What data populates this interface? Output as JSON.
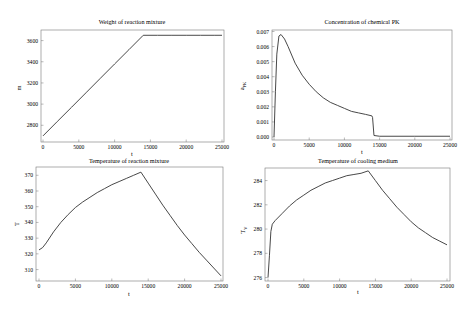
{
  "chart_data": [
    {
      "type": "line",
      "title": "Weight of reaction mixture",
      "xlabel": "t",
      "ylabel": "m",
      "xlim": [
        0,
        25000
      ],
      "ylim": [
        2680,
        3700
      ],
      "xticks": [
        0,
        5000,
        10000,
        15000,
        20000,
        25000
      ],
      "xtick_labels": [
        "0",
        "5000",
        "10000",
        "15000",
        "20000",
        "25000"
      ],
      "yticks": [
        2800,
        3000,
        3200,
        3400,
        3600
      ],
      "ytick_labels": [
        "2800",
        "3000",
        "3200",
        "3400",
        "3600"
      ],
      "grid": false,
      "series": [
        {
          "name": "m",
          "x": [
            0,
            2000,
            4000,
            6000,
            8000,
            10000,
            12000,
            14000,
            16000,
            18000,
            20000,
            22000,
            24000,
            25000
          ],
          "y": [
            2700,
            2836,
            2971,
            3107,
            3243,
            3379,
            3514,
            3650,
            3650,
            3650,
            3650,
            3650,
            3650,
            3650
          ]
        }
      ]
    },
    {
      "type": "line",
      "title": "Concentration of chemical PK",
      "xlabel": "t",
      "ylabel": "aPK",
      "xlim": [
        0,
        25000
      ],
      "ylim": [
        -0.0001,
        0.007
      ],
      "xticks": [
        0,
        5000,
        10000,
        15000,
        20000,
        25000
      ],
      "xtick_labels": [
        "0",
        "5000",
        "10000",
        "15000",
        "20000",
        "25000"
      ],
      "yticks": [
        0.0,
        0.001,
        0.002,
        0.003,
        0.004,
        0.005,
        0.006,
        0.007
      ],
      "ytick_labels": [
        "0.000",
        "0.001",
        "0.002",
        "0.003",
        "0.004",
        "0.005",
        "0.006",
        "0.007"
      ],
      "grid": false,
      "series": [
        {
          "name": "aPK",
          "x": [
            0,
            200,
            400,
            700,
            1000,
            1500,
            2000,
            3000,
            4000,
            5000,
            6000,
            7000,
            8000,
            9000,
            10000,
            11000,
            12000,
            13000,
            13900,
            14000,
            14200,
            15000,
            20000,
            25000
          ],
          "y": [
            0.0,
            0.003,
            0.0055,
            0.0067,
            0.0068,
            0.0065,
            0.006,
            0.0049,
            0.0041,
            0.0035,
            0.003,
            0.0026,
            0.0023,
            0.0021,
            0.0019,
            0.0017,
            0.0016,
            0.0015,
            0.0014,
            0.0013,
            0.0001,
            5e-05,
            5e-05,
            5e-05
          ]
        }
      ]
    },
    {
      "type": "line",
      "title": "Temperature of reaction mixture",
      "xlabel": "t",
      "ylabel": "T",
      "xlim": [
        0,
        25000
      ],
      "ylim": [
        304,
        374
      ],
      "xticks": [
        0,
        5000,
        10000,
        15000,
        20000,
        25000
      ],
      "xtick_labels": [
        "0",
        "5000",
        "10000",
        "15000",
        "20000",
        "25000"
      ],
      "yticks": [
        310,
        320,
        330,
        340,
        350,
        360,
        370
      ],
      "ytick_labels": [
        "310",
        "320",
        "330",
        "340",
        "350",
        "360",
        "370"
      ],
      "grid": false,
      "series": [
        {
          "name": "T",
          "x": [
            0,
            500,
            1000,
            2000,
            3000,
            4000,
            5000,
            6000,
            7000,
            8000,
            9000,
            10000,
            11000,
            12000,
            13000,
            14000,
            15000,
            16000,
            17000,
            18000,
            19000,
            20000,
            21000,
            22000,
            23000,
            24000,
            25000
          ],
          "y": [
            322.5,
            324,
            327,
            334,
            340,
            345,
            349.5,
            353,
            356,
            359,
            361.5,
            364,
            366,
            368,
            370,
            372,
            365,
            358,
            351,
            344.5,
            338,
            332,
            326.5,
            321,
            316,
            311,
            306
          ]
        }
      ]
    },
    {
      "type": "line",
      "title": "Temperature of cooling medium",
      "xlabel": "t",
      "ylabel": "TV",
      "xlim": [
        0,
        25000
      ],
      "ylim": [
        275.8,
        285.2
      ],
      "xticks": [
        0,
        5000,
        10000,
        15000,
        20000,
        25000
      ],
      "xtick_labels": [
        "0",
        "5000",
        "10000",
        "15000",
        "20000",
        "25000"
      ],
      "yticks": [
        276,
        278,
        280,
        282,
        284
      ],
      "ytick_labels": [
        "276",
        "278",
        "280",
        "282",
        "284"
      ],
      "grid": false,
      "series": [
        {
          "name": "TV",
          "x": [
            0,
            200,
            400,
            600,
            1000,
            2000,
            3000,
            4000,
            5000,
            6000,
            7000,
            8000,
            9000,
            10000,
            11000,
            12000,
            13000,
            14000,
            15000,
            16000,
            17000,
            18000,
            19000,
            20000,
            21000,
            22000,
            23000,
            24000,
            25000
          ],
          "y": [
            276,
            277.8,
            279.8,
            280.4,
            280.7,
            281.3,
            281.9,
            282.4,
            282.8,
            283.2,
            283.5,
            283.8,
            284.0,
            284.2,
            284.4,
            284.5,
            284.6,
            284.8,
            284.0,
            283.2,
            282.5,
            281.8,
            281.2,
            280.6,
            280.1,
            279.7,
            279.3,
            279.0,
            278.7
          ]
        }
      ]
    }
  ],
  "panels": [
    {
      "title": "Weight of reaction mixture",
      "xlabel": "t",
      "ylabel": "m"
    },
    {
      "title": "Concentration of chemical PK",
      "xlabel": "t",
      "ylabel": "a",
      "ylabel_sub": "PK"
    },
    {
      "title": "Temperature of reaction mixture",
      "xlabel": "t",
      "ylabel": "T"
    },
    {
      "title": "Temperature of cooling medium",
      "xlabel": "t",
      "ylabel": "T",
      "ylabel_sub": "V"
    }
  ]
}
